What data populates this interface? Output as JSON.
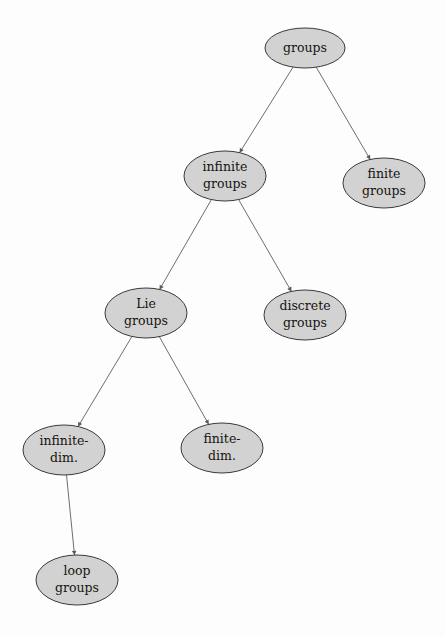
{
  "diagram": {
    "type": "tree",
    "title": "",
    "background_color": "#fdfdfd",
    "node_fill_color": "#d2d2d2",
    "node_border_color": "#3a3a3a",
    "edge_color": "#6e6e6e",
    "text_color": "#17140f",
    "nodes": [
      {
        "id": "groups",
        "label": "groups",
        "lines": [
          "groups"
        ],
        "cx": 305,
        "cy": 48,
        "rx": 40,
        "ry": 20
      },
      {
        "id": "infinite-groups",
        "label": "infinite groups",
        "lines": [
          "infinite",
          "groups"
        ],
        "cx": 225,
        "cy": 176,
        "rx": 41,
        "ry": 25
      },
      {
        "id": "finite-groups",
        "label": "finite groups",
        "lines": [
          "finite",
          "groups"
        ],
        "cx": 384,
        "cy": 183,
        "rx": 41,
        "ry": 25
      },
      {
        "id": "lie-groups",
        "label": "Lie groups",
        "lines": [
          "Lie",
          "groups"
        ],
        "cx": 146,
        "cy": 313,
        "rx": 41,
        "ry": 25
      },
      {
        "id": "discrete-groups",
        "label": "discrete groups",
        "lines": [
          "discrete",
          "groups"
        ],
        "cx": 305,
        "cy": 315,
        "rx": 41,
        "ry": 25
      },
      {
        "id": "infinite-dim",
        "label": "infinite-dim.",
        "lines": [
          "infinite-",
          "dim."
        ],
        "cx": 64,
        "cy": 450,
        "rx": 41,
        "ry": 25
      },
      {
        "id": "finite-dim",
        "label": "finite-dim.",
        "lines": [
          "finite-",
          "dim."
        ],
        "cx": 222,
        "cy": 448,
        "rx": 41,
        "ry": 25
      },
      {
        "id": "loop-groups",
        "label": "loop groups",
        "lines": [
          "loop",
          "groups"
        ],
        "cx": 77,
        "cy": 580,
        "rx": 41,
        "ry": 25
      }
    ],
    "edges": [
      {
        "from": "groups",
        "to": "infinite-groups"
      },
      {
        "from": "groups",
        "to": "finite-groups"
      },
      {
        "from": "infinite-groups",
        "to": "lie-groups"
      },
      {
        "from": "infinite-groups",
        "to": "discrete-groups"
      },
      {
        "from": "lie-groups",
        "to": "infinite-dim"
      },
      {
        "from": "lie-groups",
        "to": "finite-dim"
      },
      {
        "from": "infinite-dim",
        "to": "loop-groups"
      }
    ]
  }
}
